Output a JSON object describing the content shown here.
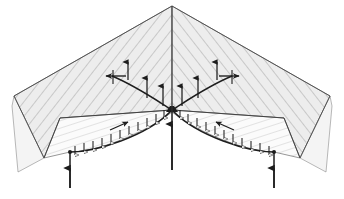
{
  "figure": {
    "type": "architectural-structural-axonometric",
    "background_color": "#ffffff",
    "line_color": "#2b2b2b",
    "hatch_color": "#9a9a9a",
    "roof_fill": "#ececec",
    "gable_fill": "#f2f2f2",
    "soffit_fill": "#fafafa",
    "arch_stroke_width": 1.6,
    "thin_stroke_width": 0.5
  },
  "canvas": {
    "width": 344,
    "height": 199
  },
  "geometry": {
    "ridge_apex": {
      "x": 172,
      "y": 6
    },
    "ridge_base": {
      "x": 172,
      "y": 110
    },
    "roof_left_outer": {
      "x": 14,
      "y": 96
    },
    "roof_right_outer": {
      "x": 330,
      "y": 96
    },
    "eave_left_front": {
      "x": 44,
      "y": 158
    },
    "eave_right_front": {
      "x": 300,
      "y": 158
    },
    "front_eave_left": {
      "x": 60,
      "y": 118
    },
    "front_eave_right": {
      "x": 284,
      "y": 118
    },
    "gable_depth": 38,
    "arch_springing_left": {
      "x": 70,
      "y": 152
    },
    "arch_crown_left": {
      "x": 122,
      "y": 118
    },
    "arch_springing_center_left": {
      "x": 168,
      "y": 112
    },
    "arch_crown_right": {
      "x": 222,
      "y": 118
    },
    "arch_springing_right": {
      "x": 274,
      "y": 152
    },
    "pier_positions_x": [
      70,
      172,
      274
    ],
    "pier_base_y": 188
  },
  "elements": {
    "roof": {
      "name": "pitched-ribbed-roof",
      "left_panel_label": "left roof slope",
      "right_panel_label": "right roof slope",
      "rib_count_per_slope": 22,
      "rib_spacing_px": 13
    },
    "gable_end_left": {
      "name": "left gable end wall"
    },
    "gable_end_right": {
      "name": "right gable end wall"
    },
    "arcade": {
      "name": "double-arch arcade",
      "bays": 2,
      "arch_type": "segmental"
    },
    "soffit_band": {
      "name": "vault soffit band",
      "description": "narrow band between arch extrados and eave line"
    }
  },
  "force_vectors": {
    "distributed_load_arrows": {
      "label": "distributed roof load on arch extrados",
      "direction": "downward-normal",
      "count_left_arch": 11,
      "count_right_arch": 11,
      "arrow_length_px": 7,
      "head_style": "open-triangle"
    },
    "upper_branch_arrows": {
      "label": "internal thrust branching from ridge node",
      "direction": "upward",
      "count": 6,
      "head_style": "solid-triangle",
      "nodes": [
        {
          "x": 128,
          "y": 66,
          "dir": "up"
        },
        {
          "x": 146,
          "y": 80,
          "dir": "up"
        },
        {
          "x": 164,
          "y": 86,
          "dir": "up"
        },
        {
          "x": 181,
          "y": 86,
          "dir": "up"
        },
        {
          "x": 199,
          "y": 80,
          "dir": "up"
        },
        {
          "x": 216,
          "y": 66,
          "dir": "up"
        }
      ]
    },
    "horizontal_thrust_arrows": {
      "label": "horizontal thrust at buttress level",
      "count": 2,
      "left": {
        "x": 108,
        "y": 76,
        "dir": "left"
      },
      "right": {
        "x": 236,
        "y": 76,
        "dir": "right"
      }
    },
    "crown_thrust_arrows": {
      "label": "crown thrust at arch haunches",
      "count": 2,
      "left": {
        "x": 126,
        "y": 124,
        "dir": "down-left"
      },
      "right": {
        "x": 218,
        "y": 124,
        "dir": "down-right"
      }
    },
    "support_reactions": {
      "label": "vertical support reactions at pier bases",
      "direction": "upward",
      "count": 3,
      "positions": [
        {
          "x": 70,
          "y": 188,
          "height": 30
        },
        {
          "x": 172,
          "y": 188,
          "height": 76
        },
        {
          "x": 274,
          "y": 188,
          "height": 30
        }
      ]
    },
    "ridge_axis": {
      "label": "vertical ridge centre axis",
      "x": 172,
      "y_top": 6,
      "y_bottom": 155
    }
  },
  "annotations": {
    "caption": "",
    "legend": []
  }
}
